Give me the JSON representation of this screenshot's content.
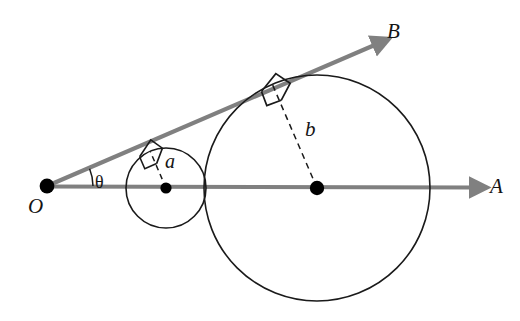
{
  "figure": {
    "type": "geometry-diagram",
    "background_color": "#ffffff",
    "width": 520,
    "height": 321
  },
  "style": {
    "ray_color": "#808080",
    "circle_stroke": "#1a1a1a",
    "label_color": "#141414",
    "dashed_color": "#1a1a1a",
    "vertex_dot_color": "#000000",
    "ray_width": 4.2,
    "circle_width": 1.6
  },
  "labels": {
    "vertex": "O",
    "ray_a_end": "A",
    "ray_b_end": "B",
    "angle": "θ",
    "small_radius": "a",
    "large_radius": "b"
  },
  "geometry": {
    "vertex": {
      "x": 47,
      "y": 186
    },
    "ray_OA": {
      "name": "ray-OA",
      "from": {
        "x": 47,
        "y": 186
      },
      "to": {
        "x": 484,
        "y": 187
      },
      "label": "A",
      "label_pos": {
        "x": 495,
        "y": 192
      }
    },
    "ray_OB": {
      "name": "ray-OB",
      "from": {
        "x": 47,
        "y": 186
      },
      "to": {
        "x": 386,
        "y": 40
      },
      "label": "B",
      "label_pos": {
        "x": 392,
        "y": 37
      },
      "angle_degrees": 23.3
    },
    "angle_arc": {
      "center": {
        "x": 47,
        "y": 186
      },
      "radius": 46,
      "label": "θ",
      "label_pos": {
        "x": 96,
        "y": 187
      }
    },
    "small_circle": {
      "name": "small-circle",
      "center": {
        "x": 166,
        "y": 188
      },
      "radius": 40,
      "tangent_point": {
        "x": 151,
        "y": 151
      },
      "radius_label": "a",
      "radius_label_pos": {
        "x": 167,
        "y": 167
      }
    },
    "large_circle": {
      "name": "large-circle",
      "center": {
        "x": 317,
        "y": 188
      },
      "radius": 113,
      "tangent_point": {
        "x": 273,
        "y": 84
      },
      "radius_label": "b",
      "radius_label_pos": {
        "x": 307,
        "y": 134
      }
    },
    "vertex_label_pos": {
      "x": 28,
      "y": 212
    }
  }
}
